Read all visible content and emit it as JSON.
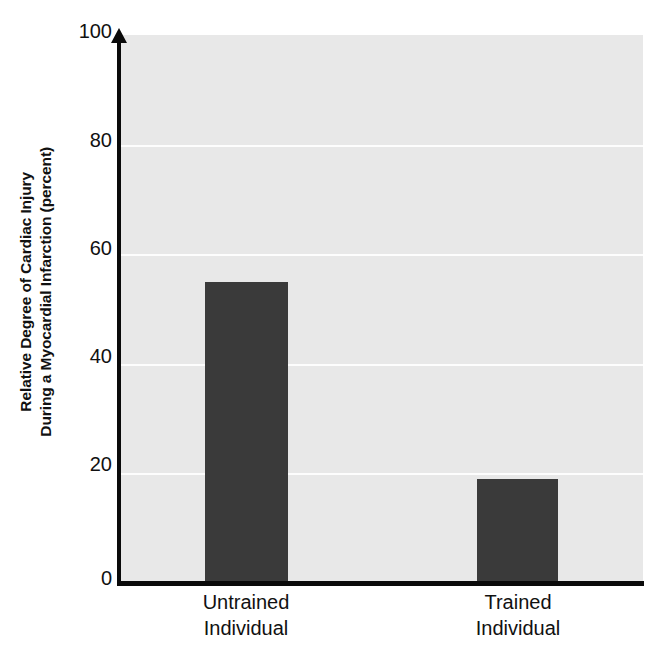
{
  "chart_data": {
    "type": "bar",
    "title": "",
    "subtitle": "",
    "xlabel": "",
    "ylabel": "Relative Degree of Cardiac Injury During a Myocardial Infarction (percent)",
    "ylabel_lines": [
      "Relative Degree of Cardiac Injury",
      "During a Myocardial Infarction (percent)"
    ],
    "categories": [
      "Untrained Individual",
      "Trained Individual"
    ],
    "category_lines": [
      [
        "Untrained",
        "Individual"
      ],
      [
        "Trained",
        "Individual"
      ]
    ],
    "values": [
      55,
      19
    ],
    "ylim": [
      0,
      100
    ],
    "yticks": [
      0,
      20,
      40,
      60,
      80,
      100
    ],
    "ytick_labels": [
      "0",
      "20",
      "40",
      "60",
      "80",
      "100"
    ],
    "grid": true,
    "grid_axis": "y",
    "legend": false,
    "legend_position": "none",
    "bar_color": "#3a3a3a",
    "plot_background": "#e8e8e8",
    "figure_background": "#ffffff",
    "gridline_color": "#fdfdfd",
    "axis_color": "#0a0a0a",
    "y_axis_arrow": true
  },
  "axis": {
    "tick_100": "100",
    "tick_80": "80",
    "tick_60": "60",
    "tick_40": "40",
    "tick_20": "20",
    "tick_0": "0"
  },
  "ylabel": {
    "line1": "Relative Degree of Cardiac Injury",
    "line2": "During a Myocardial Infarction (percent)"
  },
  "xlabels": {
    "cat1_line1": "Untrained",
    "cat1_line2": "Individual",
    "cat2_line1": "Trained",
    "cat2_line2": "Individual"
  }
}
